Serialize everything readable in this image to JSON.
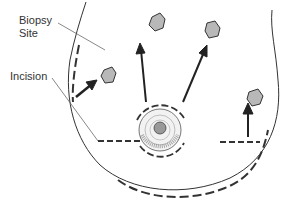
{
  "labels": {
    "biopsy_line1": "Biopsy",
    "biopsy_line2": "Site",
    "incision": "Incision"
  },
  "colors": {
    "line": "#333333",
    "lesion_fill": "#b8b8b8",
    "background": "#ffffff"
  }
}
